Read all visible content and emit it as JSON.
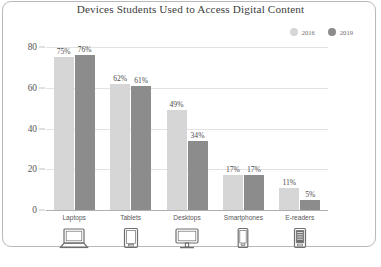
{
  "chart_data": {
    "type": "bar",
    "title": "Devices Students Used to Access Digital Content",
    "xlabel": "",
    "ylabel": "",
    "ylim": [
      0,
      80
    ],
    "yticks": [
      0,
      20,
      40,
      60,
      80
    ],
    "ytick_labels": [
      "0",
      "20",
      "40",
      "60",
      "80"
    ],
    "grid": true,
    "legend_position": "top-right",
    "categories": [
      "Laptops",
      "Tablets",
      "Desktops",
      "Smartphones",
      "E-readers"
    ],
    "series": [
      {
        "name": "2016",
        "color": "#d6d6d6",
        "values": [
          75,
          62,
          49,
          17,
          11
        ],
        "labels": [
          "75%",
          "62%",
          "49%",
          "17%",
          "11%"
        ]
      },
      {
        "name": "2019",
        "color": "#8c8c8c",
        "values": [
          76,
          61,
          34,
          17,
          5
        ],
        "labels": [
          "76%",
          "61%",
          "34%",
          "17%",
          "5%"
        ]
      }
    ],
    "category_icons": [
      "laptop-icon",
      "tablet-icon",
      "desktop-monitor-icon",
      "smartphone-icon",
      "e-reader-icon"
    ]
  },
  "legend": {
    "items": [
      {
        "label": "2016",
        "color": "#d6d6d6"
      },
      {
        "label": "2019",
        "color": "#8c8c8c"
      }
    ]
  },
  "colors": {
    "series_2016": "#d6d6d6",
    "series_2019": "#8c8c8c",
    "gridline": "#e2e2e2",
    "axis": "#b0b0b0",
    "frame_border": "#b9b9b9",
    "text": "#3d3d3d",
    "background": "#ffffff"
  }
}
